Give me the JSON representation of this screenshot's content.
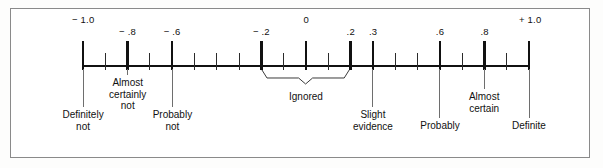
{
  "chart_data": {
    "type": "scale-diagram",
    "title": "",
    "xlabel": "",
    "ylabel": "",
    "axis": {
      "min": -1.0,
      "max": 1.0,
      "tick_step": 0.1,
      "orientation": "horizontal",
      "grid": false,
      "legend_position": "none"
    },
    "numeric_ticks": [
      {
        "value": -1.0,
        "label": "− 1.0",
        "emphasis": "major"
      },
      {
        "value": -0.9,
        "label": "",
        "emphasis": "minor"
      },
      {
        "value": -0.8,
        "label": "− .8",
        "emphasis": "major"
      },
      {
        "value": -0.7,
        "label": "",
        "emphasis": "minor"
      },
      {
        "value": -0.6,
        "label": "− .6",
        "emphasis": "major"
      },
      {
        "value": -0.5,
        "label": "",
        "emphasis": "minor"
      },
      {
        "value": -0.4,
        "label": "",
        "emphasis": "minor"
      },
      {
        "value": -0.3,
        "label": "",
        "emphasis": "minor"
      },
      {
        "value": -0.2,
        "label": "− .2",
        "emphasis": "major"
      },
      {
        "value": -0.1,
        "label": "",
        "emphasis": "minor"
      },
      {
        "value": 0.0,
        "label": "0",
        "emphasis": "major"
      },
      {
        "value": 0.1,
        "label": "",
        "emphasis": "minor"
      },
      {
        "value": 0.2,
        "label": ".2",
        "emphasis": "major"
      },
      {
        "value": 0.3,
        "label": ".3",
        "emphasis": "major"
      },
      {
        "value": 0.4,
        "label": "",
        "emphasis": "minor"
      },
      {
        "value": 0.5,
        "label": "",
        "emphasis": "minor"
      },
      {
        "value": 0.6,
        "label": ".6",
        "emphasis": "major"
      },
      {
        "value": 0.7,
        "label": "",
        "emphasis": "minor"
      },
      {
        "value": 0.8,
        "label": ".8",
        "emphasis": "major"
      },
      {
        "value": 0.9,
        "label": "",
        "emphasis": "minor"
      },
      {
        "value": 1.0,
        "label": "+ 1.0",
        "emphasis": "major"
      }
    ],
    "category_labels": [
      {
        "value": -1.0,
        "lines": [
          "Definitely",
          "not"
        ]
      },
      {
        "value": -0.8,
        "lines": [
          "Almost",
          "certainly",
          "not"
        ]
      },
      {
        "value": -0.6,
        "lines": [
          "Probably",
          "not"
        ]
      },
      {
        "value": 0.3,
        "lines": [
          "Slight",
          "evidence"
        ]
      },
      {
        "value": 0.6,
        "lines": [
          "Probably"
        ]
      },
      {
        "value": 0.8,
        "lines": [
          "Almost",
          "certain"
        ]
      },
      {
        "value": 1.0,
        "lines": [
          "Definite"
        ]
      }
    ],
    "bracket": {
      "label": "Ignored",
      "from": -0.2,
      "to": 0.2
    }
  }
}
